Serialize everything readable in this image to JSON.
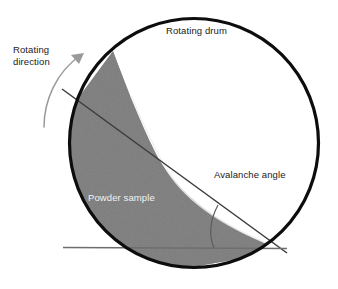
{
  "figure": {
    "name": "rotating-drum-avalanche-angle-diagram",
    "background_color": "#ffffff"
  },
  "labels": {
    "rotating_drum": "Rotating drum",
    "rotating_direction_line1": "Rotating",
    "rotating_direction_line2": "direction",
    "avalanche_angle": "Avalanche angle",
    "powder_sample": "Powder sample"
  },
  "colors": {
    "drum_outline": "#0d0d0d",
    "powder_fill": "#808080",
    "powder_fill_shade": "#7a7a7a",
    "slope_line": "#3b3b3b",
    "horizontal_line": "#6e6e6e",
    "angle_arc": "#5a5a5a",
    "arrow": "#9a9a9a",
    "label_dark": "#1a1a1a",
    "label_light": "#f2f2f2"
  },
  "geometry": {
    "drum_center_x": 194,
    "drum_center_y": 143,
    "drum_radius": 126,
    "drum_stroke_width": 3.2,
    "powder_top_contact_x": 113,
    "powder_top_contact_y": 51,
    "powder_vertex_x": 277,
    "powder_vertex_y": 248,
    "slope_line_start_x": 62,
    "slope_line_start_y": 89,
    "slope_line_end_x": 287,
    "slope_line_end_y": 253,
    "horizontal_line_start_x": 63,
    "horizontal_line_start_y": 247,
    "horizontal_line_end_x": 287,
    "horizontal_line_end_y": 248,
    "angle_arc_radius": 62,
    "rotation_arrow_tip_x": 83,
    "rotation_arrow_tip_y": 53
  },
  "icons": {
    "rotation_arrow": "curved-arrow-counterclockwise-icon",
    "angle_arc": "angle-arc-icon"
  }
}
